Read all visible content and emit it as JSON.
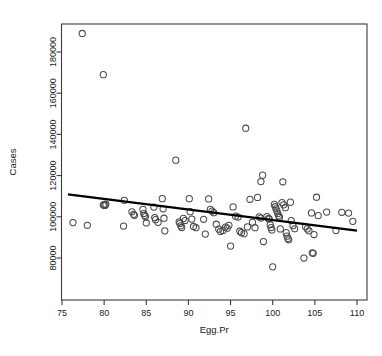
{
  "chart_data": {
    "type": "scatter",
    "title": "",
    "xlabel": "Egg.Pr",
    "ylabel": "Cases",
    "xlim": [
      75,
      110
    ],
    "ylim": [
      70000,
      192000
    ],
    "grid": false,
    "legend": null,
    "xticks": [
      75,
      80,
      85,
      90,
      95,
      100,
      105,
      110
    ],
    "xtick_labels": [
      "75",
      "80",
      "85",
      "90",
      "95",
      "100",
      "105",
      "110"
    ],
    "yticks": [
      80000,
      100000,
      120000,
      140000,
      160000,
      180000
    ],
    "ytick_labels": [
      "80000",
      "100000",
      "120000",
      "140000",
      "160000",
      "180000"
    ],
    "marker": "open-circle",
    "point_color": "#4a4a4a",
    "line_color": "#000000",
    "series": [
      {
        "name": "Cases vs Egg.Pr",
        "points": [
          [
            77.4,
            189000
          ],
          [
            79.9,
            169000
          ],
          [
            96.8,
            143000
          ],
          [
            88.5,
            127500
          ],
          [
            98.8,
            120200
          ],
          [
            101.2,
            117000
          ],
          [
            98.6,
            117100
          ],
          [
            76.3,
            97200
          ],
          [
            78.0,
            95900
          ],
          [
            80.0,
            105900
          ],
          [
            80.1,
            105500
          ],
          [
            80.2,
            106100
          ],
          [
            79.9,
            105700
          ],
          [
            82.4,
            108000
          ],
          [
            82.3,
            95500
          ],
          [
            83.3,
            102400
          ],
          [
            83.5,
            101200
          ],
          [
            83.6,
            100700
          ],
          [
            84.6,
            103600
          ],
          [
            84.7,
            101600
          ],
          [
            84.8,
            100700
          ],
          [
            84.9,
            100100
          ],
          [
            85.0,
            97000
          ],
          [
            85.9,
            104700
          ],
          [
            86.0,
            99600
          ],
          [
            86.1,
            98600
          ],
          [
            86.4,
            97300
          ],
          [
            86.9,
            108800
          ],
          [
            87.0,
            103900
          ],
          [
            87.1,
            99300
          ],
          [
            87.2,
            93200
          ],
          [
            88.9,
            97500
          ],
          [
            89.0,
            96800
          ],
          [
            89.1,
            95600
          ],
          [
            89.2,
            94800
          ],
          [
            89.4,
            99200
          ],
          [
            89.6,
            98200
          ],
          [
            90.1,
            108800
          ],
          [
            90.2,
            102500
          ],
          [
            90.4,
            98900
          ],
          [
            90.6,
            95300
          ],
          [
            90.9,
            94700
          ],
          [
            91.8,
            98800
          ],
          [
            92.0,
            91600
          ],
          [
            92.4,
            108700
          ],
          [
            92.6,
            103600
          ],
          [
            92.8,
            102800
          ],
          [
            93.0,
            102000
          ],
          [
            93.3,
            96400
          ],
          [
            93.6,
            94000
          ],
          [
            93.8,
            92900
          ],
          [
            94.1,
            93400
          ],
          [
            94.4,
            95000
          ],
          [
            94.6,
            94500
          ],
          [
            94.8,
            95900
          ],
          [
            95.0,
            85800
          ],
          [
            95.3,
            104800
          ],
          [
            95.6,
            100300
          ],
          [
            95.9,
            99900
          ],
          [
            96.1,
            93000
          ],
          [
            96.3,
            92300
          ],
          [
            96.6,
            91800
          ],
          [
            97.0,
            95100
          ],
          [
            97.3,
            108500
          ],
          [
            97.6,
            97300
          ],
          [
            97.9,
            94700
          ],
          [
            98.2,
            109400
          ],
          [
            98.4,
            100000
          ],
          [
            98.6,
            99400
          ],
          [
            98.9,
            88000
          ],
          [
            99.3,
            100100
          ],
          [
            99.5,
            99200
          ],
          [
            99.6,
            98900
          ],
          [
            99.7,
            96200
          ],
          [
            99.8,
            94800
          ],
          [
            99.9,
            93600
          ],
          [
            100.0,
            75700
          ],
          [
            100.2,
            106000
          ],
          [
            100.3,
            104900
          ],
          [
            100.4,
            103900
          ],
          [
            100.5,
            102800
          ],
          [
            100.6,
            101600
          ],
          [
            100.7,
            100500
          ],
          [
            100.8,
            99800
          ],
          [
            100.9,
            94100
          ],
          [
            101.1,
            106900
          ],
          [
            101.3,
            105800
          ],
          [
            101.5,
            104400
          ],
          [
            101.6,
            92300
          ],
          [
            101.7,
            90600
          ],
          [
            101.8,
            89500
          ],
          [
            101.9,
            88800
          ],
          [
            102.1,
            107100
          ],
          [
            102.2,
            98200
          ],
          [
            102.4,
            95700
          ],
          [
            102.6,
            94200
          ],
          [
            103.7,
            80000
          ],
          [
            103.9,
            95200
          ],
          [
            104.1,
            94100
          ],
          [
            104.3,
            93200
          ],
          [
            104.6,
            101900
          ],
          [
            104.7,
            82500
          ],
          [
            104.8,
            82300
          ],
          [
            104.9,
            91400
          ],
          [
            105.2,
            109500
          ],
          [
            105.4,
            100600
          ],
          [
            106.4,
            102300
          ],
          [
            107.5,
            93400
          ],
          [
            108.2,
            102200
          ],
          [
            109.0,
            101800
          ],
          [
            109.5,
            97800
          ]
        ]
      }
    ],
    "fit_line": {
      "name": "regression-line",
      "x_start": 75.7,
      "y_start": 110900,
      "x_end": 110.0,
      "y_end": 93300
    }
  }
}
